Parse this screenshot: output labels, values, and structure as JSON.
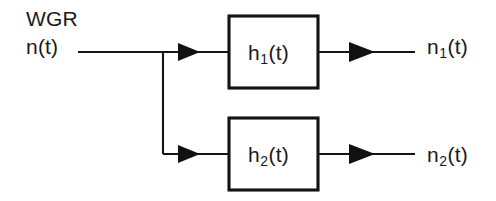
{
  "diagram": {
    "type": "block-diagram",
    "canvas": {
      "width": 496,
      "height": 201,
      "background": "#ffffff"
    },
    "stroke_color": "#151515",
    "text_color": "#1a1a1a",
    "source": {
      "name_label": "WGR",
      "signal_base": "n",
      "signal_suffix": "(t)",
      "signal_label": "n(t)"
    },
    "blocks": [
      {
        "id": "block-h1",
        "base": "h",
        "subscript": "1",
        "suffix": "(t)",
        "label": "h1(t)",
        "x": 229,
        "y": 16,
        "width": 89,
        "height": 72
      },
      {
        "id": "block-h2",
        "base": "h",
        "subscript": "2",
        "suffix": "(t)",
        "label": "h2(t)",
        "x": 229,
        "y": 118,
        "width": 89,
        "height": 72
      }
    ],
    "outputs": [
      {
        "id": "output-n1",
        "base": "n",
        "subscript": "1",
        "suffix": "(t)",
        "label": "n1(t)"
      },
      {
        "id": "output-n2",
        "base": "n",
        "subscript": "2",
        "suffix": "(t)",
        "label": "n2(t)"
      }
    ],
    "wires": {
      "input_y": 52,
      "lower_y": 154,
      "input_start_x": 78,
      "branch_x": 163,
      "output_end_x": 415,
      "arrow_direction": "right"
    }
  }
}
